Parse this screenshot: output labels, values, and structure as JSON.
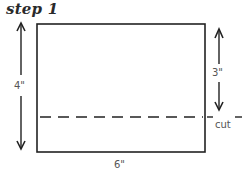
{
  "title": "step 1",
  "labels": {
    "height": "4\"",
    "width": "6\"",
    "cut_distance": "3\"",
    "cut": "cut"
  },
  "colors": {
    "line": "#222222",
    "text": "#555555",
    "background": "#ffffff"
  }
}
